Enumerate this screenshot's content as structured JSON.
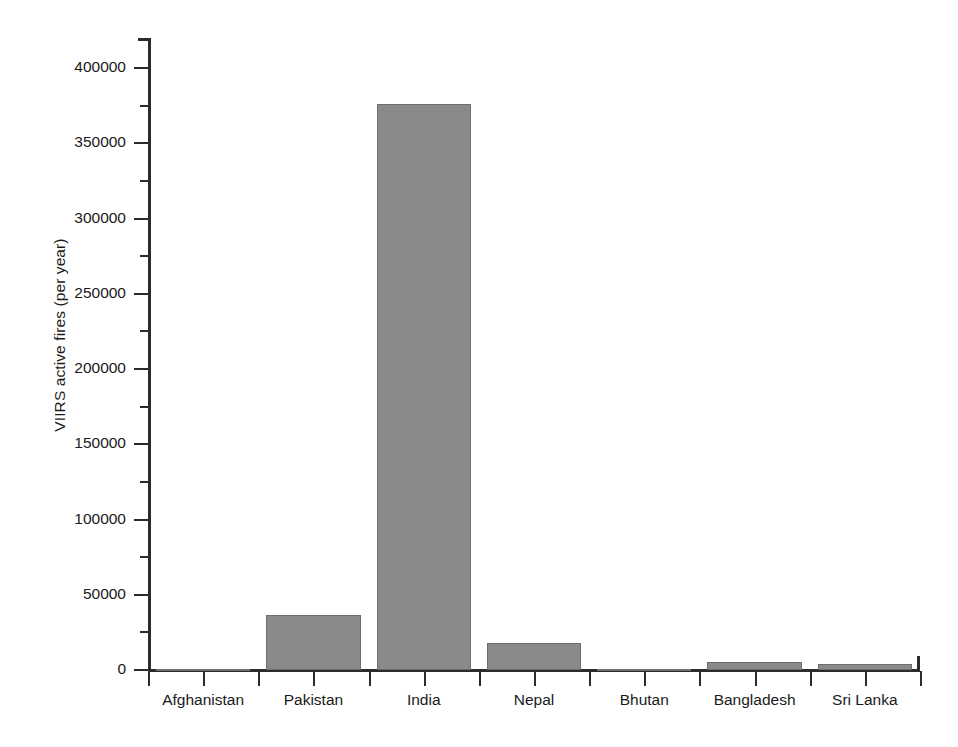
{
  "chart": {
    "ylabel": "VIIRS active fires (per year)",
    "bar_color": "#8a8a8a",
    "bar_edge_color": "#6e6e6e",
    "axis_color": "#2b2b2b",
    "background": "#ffffff"
  },
  "chart_data": {
    "type": "bar",
    "title": "",
    "xlabel": "",
    "ylabel": "VIIRS active fires (per year)",
    "categories": [
      "Afghanistan",
      "Pakistan",
      "India",
      "Nepal",
      "Bhutan",
      "Bangladesh",
      "Sri Lanka"
    ],
    "values": [
      300,
      36800,
      376000,
      18000,
      200,
      5200,
      4300
    ],
    "ylim": [
      0,
      422000
    ],
    "ytick_values": [
      0,
      50000,
      100000,
      150000,
      200000,
      250000,
      300000,
      350000,
      400000
    ],
    "ytick_labels": [
      "0",
      "50000",
      "100000",
      "150000",
      "200000",
      "250000",
      "300000",
      "350000",
      "400000"
    ],
    "yminor_tick_values": [
      25000,
      75000,
      125000,
      175000,
      225000,
      275000,
      325000,
      375000
    ],
    "grid": false,
    "legend": false,
    "legend_position": "none",
    "series": [
      {
        "name": "VIIRS active fires (per year)",
        "values": [
          300,
          36800,
          376000,
          18000,
          200,
          5200,
          4300
        ]
      }
    ]
  }
}
